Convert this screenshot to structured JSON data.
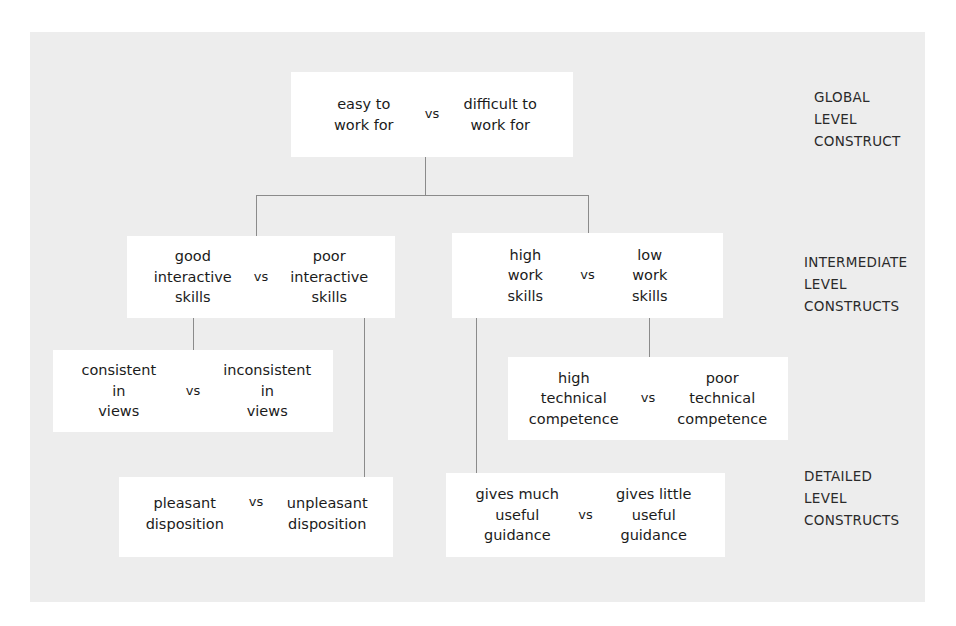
{
  "diagram": {
    "panel_color": "#ededed",
    "box_color": "#ffffff",
    "line_color": "#8b8b8b",
    "text_color": "#1b1b1b",
    "vs_label": "vs",
    "levels": [
      {
        "id": "global",
        "label": "GLOBAL\nLEVEL\nCONSTRUCT"
      },
      {
        "id": "intermediate",
        "label": "INTERMEDIATE\nLEVEL\nCONSTRUCTS"
      },
      {
        "id": "detailed",
        "label": "DETAILED\nLEVEL\nCONSTRUCTS"
      }
    ],
    "constructs": [
      {
        "id": "global",
        "level": "global",
        "left_pole": "easy to\nwork for",
        "vs": "vs",
        "right_pole": "difficult to\nwork for"
      },
      {
        "id": "interactive-skills",
        "level": "intermediate",
        "left_pole": "good\ninteractive\nskills",
        "vs": "vs",
        "right_pole": "poor\ninteractive\nskills"
      },
      {
        "id": "work-skills",
        "level": "intermediate",
        "left_pole": "high\nwork\nskills",
        "vs": "vs",
        "right_pole": "low\nwork\nskills"
      },
      {
        "id": "views",
        "level": "detailed",
        "left_pole": "consistent\nin\nviews",
        "vs": "vs",
        "right_pole": "inconsistent\nin\nviews"
      },
      {
        "id": "technical-competence",
        "level": "detailed",
        "left_pole": "high\ntechnical\ncompetence",
        "vs": "vs",
        "right_pole": "poor\ntechnical\ncompetence"
      },
      {
        "id": "disposition",
        "level": "detailed",
        "left_pole": "pleasant\ndisposition",
        "vs": "vs",
        "right_pole": "unpleasant\ndisposition"
      },
      {
        "id": "guidance",
        "level": "detailed",
        "left_pole": "gives much\nuseful\nguidance",
        "vs": "vs",
        "right_pole": "gives little\nuseful\nguidance"
      }
    ]
  }
}
